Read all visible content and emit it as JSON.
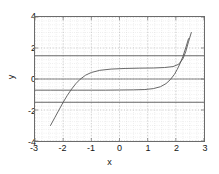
{
  "chart_data": {
    "type": "line",
    "title": "",
    "xlabel": "x",
    "ylabel": "y",
    "xlim": [
      -3,
      3
    ],
    "ylim": [
      -4,
      4
    ],
    "xticks": [
      -3,
      -2,
      -1,
      0,
      1,
      2,
      3
    ],
    "xticklabels": [
      "-3",
      "-2",
      "-1",
      "0",
      "1",
      "2",
      "3"
    ],
    "yticks": [
      -4,
      -2,
      0,
      2,
      4
    ],
    "yticklabels": [
      "-4",
      "-2",
      "0",
      "2",
      "4"
    ],
    "grid": true,
    "grid_style": "dotted",
    "legend": null,
    "series": [
      {
        "name": "upper-asymptote-line",
        "style": "solid",
        "color": "#555555",
        "x": [
          -3,
          3
        ],
        "y": [
          1.5,
          1.5
        ]
      },
      {
        "name": "lower-asymptote-line",
        "style": "solid",
        "color": "#555555",
        "x": [
          -3,
          3
        ],
        "y": [
          -1.5,
          -1.5
        ]
      },
      {
        "name": "zero-line",
        "style": "solid",
        "color": "#777777",
        "x": [
          -3,
          3
        ],
        "y": [
          0,
          0
        ]
      },
      {
        "name": "upper-sigmoid-branch",
        "style": "solid",
        "color": "#555555",
        "x": [
          -2.45,
          -2.3,
          -2.15,
          -2.0,
          -1.85,
          -1.7,
          -1.55,
          -1.4,
          -1.2,
          -1.0,
          -0.7,
          -0.3,
          0.2,
          0.7,
          1.2,
          1.6,
          1.9,
          2.1,
          2.25,
          2.35,
          2.45,
          2.55
        ],
        "y": [
          -3.0,
          -2.5,
          -2.0,
          -1.5,
          -1.05,
          -0.65,
          -0.3,
          -0.02,
          0.25,
          0.42,
          0.56,
          0.64,
          0.68,
          0.7,
          0.71,
          0.74,
          0.8,
          0.95,
          1.3,
          1.75,
          2.4,
          3.0
        ]
      },
      {
        "name": "lower-sigmoid-branch",
        "style": "solid",
        "color": "#555555",
        "x": [
          -3.0,
          -2.45,
          -2.0,
          -1.5,
          -1.0,
          -0.5,
          0.0,
          0.5,
          0.9,
          1.2,
          1.45,
          1.65,
          1.8,
          1.95,
          2.05,
          2.15,
          2.25,
          2.35,
          2.45
        ],
        "y": [
          -0.72,
          -0.72,
          -0.72,
          -0.72,
          -0.72,
          -0.72,
          -0.71,
          -0.7,
          -0.68,
          -0.62,
          -0.5,
          -0.3,
          -0.05,
          0.3,
          0.62,
          1.0,
          1.45,
          2.0,
          2.6
        ]
      }
    ]
  },
  "axis_label_x": "x",
  "axis_label_y": "y"
}
